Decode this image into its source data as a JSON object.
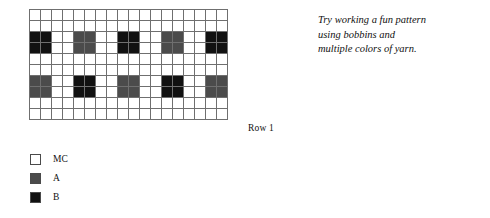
{
  "chart_data": {
    "type": "heatmap",
    "columns": 18,
    "rows": 10,
    "xlabel": "",
    "ylabel": "",
    "grid": true,
    "legend_position": "below-left",
    "palette": {
      "MC": "#ffffff",
      "A": "#4b4b4b",
      "B": "#111111"
    },
    "row_order": "bottom-up",
    "cells": [
      [
        "MC",
        "MC",
        "MC",
        "MC",
        "MC",
        "MC",
        "MC",
        "MC",
        "MC",
        "MC",
        "MC",
        "MC",
        "MC",
        "MC",
        "MC",
        "MC",
        "MC",
        "MC"
      ],
      [
        "MC",
        "MC",
        "MC",
        "MC",
        "MC",
        "MC",
        "MC",
        "MC",
        "MC",
        "MC",
        "MC",
        "MC",
        "MC",
        "MC",
        "MC",
        "MC",
        "MC",
        "MC"
      ],
      [
        "B",
        "B",
        "MC",
        "MC",
        "A",
        "A",
        "MC",
        "MC",
        "B",
        "B",
        "MC",
        "MC",
        "A",
        "A",
        "MC",
        "MC",
        "B",
        "B"
      ],
      [
        "B",
        "B",
        "MC",
        "MC",
        "A",
        "A",
        "MC",
        "MC",
        "B",
        "B",
        "MC",
        "MC",
        "A",
        "A",
        "MC",
        "MC",
        "B",
        "B"
      ],
      [
        "MC",
        "MC",
        "MC",
        "MC",
        "MC",
        "MC",
        "MC",
        "MC",
        "MC",
        "MC",
        "MC",
        "MC",
        "MC",
        "MC",
        "MC",
        "MC",
        "MC",
        "MC"
      ],
      [
        "MC",
        "MC",
        "MC",
        "MC",
        "MC",
        "MC",
        "MC",
        "MC",
        "MC",
        "MC",
        "MC",
        "MC",
        "MC",
        "MC",
        "MC",
        "MC",
        "MC",
        "MC"
      ],
      [
        "A",
        "A",
        "MC",
        "MC",
        "B",
        "B",
        "MC",
        "MC",
        "A",
        "A",
        "MC",
        "MC",
        "B",
        "B",
        "MC",
        "MC",
        "A",
        "A"
      ],
      [
        "A",
        "A",
        "MC",
        "MC",
        "B",
        "B",
        "MC",
        "MC",
        "A",
        "A",
        "MC",
        "MC",
        "B",
        "B",
        "MC",
        "MC",
        "A",
        "A"
      ],
      [
        "MC",
        "MC",
        "MC",
        "MC",
        "MC",
        "MC",
        "MC",
        "MC",
        "MC",
        "MC",
        "MC",
        "MC",
        "MC",
        "MC",
        "MC",
        "MC",
        "MC",
        "MC"
      ],
      [
        "MC",
        "MC",
        "MC",
        "MC",
        "MC",
        "MC",
        "MC",
        "MC",
        "MC",
        "MC",
        "MC",
        "MC",
        "MC",
        "MC",
        "MC",
        "MC",
        "MC",
        "MC"
      ]
    ],
    "annotations": [
      {
        "text": "Row 1",
        "anchor": "bottom-right"
      }
    ]
  },
  "row_label": "Row 1",
  "legend": {
    "items": [
      {
        "key": "MC",
        "label": "MC",
        "color": "#ffffff"
      },
      {
        "key": "A",
        "label": "A",
        "color": "#4b4b4b"
      },
      {
        "key": "B",
        "label": "B",
        "color": "#111111"
      }
    ]
  },
  "note": {
    "lines": [
      "Try working a fun pattern",
      "using bobbins and",
      "multiple colors of yarn."
    ]
  }
}
